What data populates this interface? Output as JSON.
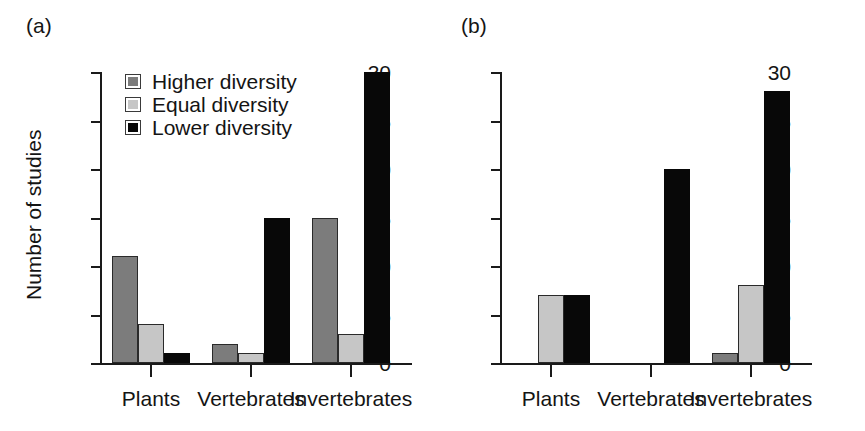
{
  "figure": {
    "panels": [
      {
        "key": "a",
        "label": "(a)",
        "ylabel": "Number of studies"
      },
      {
        "key": "b",
        "label": "(b)",
        "ylabel": ""
      }
    ]
  },
  "legend": {
    "items": [
      {
        "label": "Higher diversity",
        "color": "#7c7c7c",
        "swatch": "higher-diversity-swatch"
      },
      {
        "label": "Equal diversity",
        "color": "#c6c6c6",
        "swatch": "equal-diversity-swatch"
      },
      {
        "label": "Lower diversity",
        "color": "#080808",
        "swatch": "lower-diversity-swatch"
      }
    ]
  },
  "axis": {
    "y_ticks": [
      "0",
      "5",
      "10",
      "15",
      "20",
      "25",
      "30"
    ],
    "x_ticks": [
      "Plants",
      "Vertebrates",
      "Invertebrates"
    ]
  },
  "chart_data": [
    {
      "type": "bar",
      "panel": "(a)",
      "title": "",
      "xlabel": "",
      "ylabel": "Number of studies",
      "ylim": [
        0,
        30
      ],
      "ytick_step": 5,
      "grid": false,
      "legend_position": "top-left",
      "categories": [
        "Plants",
        "Vertebrates",
        "Invertebrates"
      ],
      "series": [
        {
          "name": "Higher diversity",
          "color": "#7c7c7c",
          "values": [
            11,
            2,
            15
          ]
        },
        {
          "name": "Equal diversity",
          "color": "#c6c6c6",
          "values": [
            4,
            1,
            3
          ]
        },
        {
          "name": "Lower diversity",
          "color": "#080808",
          "values": [
            1,
            15,
            30
          ]
        }
      ]
    },
    {
      "type": "bar",
      "panel": "(b)",
      "title": "",
      "xlabel": "",
      "ylabel": "",
      "ylim": [
        0,
        30
      ],
      "ytick_step": 5,
      "grid": false,
      "legend_position": "top-left",
      "categories": [
        "Plants",
        "Vertebrates",
        "Invertebrates"
      ],
      "series": [
        {
          "name": "Higher diversity",
          "color": "#7c7c7c",
          "values": [
            0,
            0,
            1
          ]
        },
        {
          "name": "Equal diversity",
          "color": "#c6c6c6",
          "values": [
            7,
            0,
            8
          ]
        },
        {
          "name": "Lower diversity",
          "color": "#080808",
          "values": [
            7,
            20,
            28
          ]
        }
      ]
    }
  ]
}
